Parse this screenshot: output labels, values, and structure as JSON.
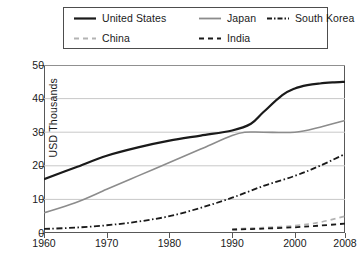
{
  "chart_data": {
    "type": "line",
    "title": "",
    "subtitle": "",
    "xlabel": "",
    "ylabel": "USD Thousands",
    "xlim": [
      1960,
      2008
    ],
    "ylim": [
      0,
      50
    ],
    "xticks": [
      "1960",
      "1970",
      "1980",
      "1990",
      "2000",
      "2008"
    ],
    "xtick_values": [
      1960,
      1970,
      1980,
      1990,
      2000,
      2008
    ],
    "yticks": [
      "0",
      "10",
      "20",
      "30",
      "40",
      "50"
    ],
    "ytick_values": [
      0,
      10,
      20,
      30,
      40,
      50
    ],
    "grid": "horizontal",
    "legend_position": "top",
    "series": [
      {
        "name": "United States",
        "color": "#1a1a1a",
        "dash": "solid",
        "width": 2.2,
        "x": [
          1960,
          1965,
          1970,
          1975,
          1980,
          1985,
          1990,
          1993,
          1995,
          1998,
          2000,
          2002,
          2004,
          2006,
          2008
        ],
        "values": [
          16.0,
          19.5,
          23.0,
          25.5,
          27.5,
          29.0,
          30.5,
          32.5,
          36.0,
          41.0,
          43.0,
          44.0,
          44.5,
          44.8,
          45.0
        ]
      },
      {
        "name": "Japan",
        "color": "#8c8c8c",
        "dash": "solid",
        "width": 1.6,
        "x": [
          1960,
          1965,
          1970,
          1975,
          1980,
          1985,
          1990,
          1992,
          1995,
          2000,
          2004,
          2008
        ],
        "values": [
          6.0,
          9.0,
          13.0,
          17.0,
          21.0,
          25.0,
          29.0,
          30.0,
          30.0,
          30.0,
          31.5,
          33.5
        ]
      },
      {
        "name": "South Korea",
        "color": "#1a1a1a",
        "dash": "dashdot",
        "width": 1.8,
        "x": [
          1960,
          1965,
          1970,
          1975,
          1980,
          1985,
          1990,
          1995,
          2000,
          2004,
          2008
        ],
        "values": [
          1.2,
          1.6,
          2.3,
          3.4,
          5.0,
          7.5,
          10.5,
          14.0,
          17.0,
          20.0,
          23.5
        ]
      },
      {
        "name": "China",
        "color": "#b3b3b3",
        "dash": "dashed",
        "width": 1.6,
        "x": [
          1990,
          1995,
          2000,
          2004,
          2008
        ],
        "values": [
          1.2,
          1.6,
          2.2,
          3.2,
          5.0
        ]
      },
      {
        "name": "India",
        "color": "#1a1a1a",
        "dash": "dashed",
        "width": 1.8,
        "x": [
          1990,
          1995,
          2000,
          2004,
          2008
        ],
        "values": [
          1.0,
          1.3,
          1.7,
          2.2,
          2.8
        ]
      }
    ]
  },
  "legend": {
    "rows": [
      [
        {
          "label": "United States",
          "key": "united-states"
        },
        {
          "label": "Japan",
          "key": "japan"
        },
        {
          "label": "South Korea",
          "key": "south-korea"
        }
      ],
      [
        {
          "label": "China",
          "key": "china"
        },
        {
          "label": "India",
          "key": "india"
        }
      ]
    ]
  },
  "colors": {
    "axis": "#585858",
    "grid": "#c8c8c8",
    "text": "#1a1a1a",
    "background": "#ffffff"
  }
}
